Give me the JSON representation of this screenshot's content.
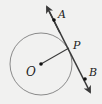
{
  "diagram": {
    "type": "geometry",
    "circle": {
      "center_label": "O",
      "cx": 41,
      "cy": 64,
      "r": 31,
      "stroke": "#8a8a8a"
    },
    "radius": {
      "from": "O",
      "to": "P"
    },
    "line": {
      "label_points": [
        "A",
        "P",
        "B"
      ],
      "arrows": "both",
      "stroke": "#3a3a3a"
    },
    "points": [
      {
        "label": "A",
        "x": 54,
        "y": 20
      },
      {
        "label": "P",
        "x": 69,
        "y": 48
      },
      {
        "label": "B",
        "x": 85,
        "y": 79
      },
      {
        "label": "O",
        "x": 41,
        "y": 64
      }
    ],
    "labels": {
      "A": "A",
      "P": "P",
      "B": "B",
      "O": "O"
    }
  }
}
